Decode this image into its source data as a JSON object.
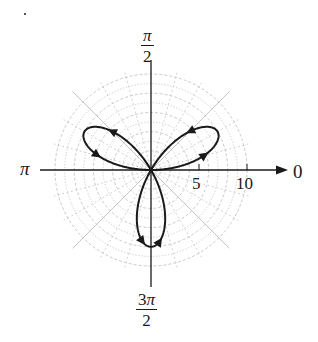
{
  "chart_data": {
    "type": "polar-line",
    "title": "",
    "equation_inferred": "r = 8 sin(3θ)",
    "curve": {
      "kind": "rose",
      "petals": 3,
      "amplitude": 8,
      "petal_directions": [
        "π/6",
        "5π/6",
        "3π/2"
      ],
      "direction_arrows": true
    },
    "radial_axis": {
      "ticks": [
        5,
        10
      ],
      "tick_labels": [
        "5",
        "10"
      ],
      "grid_circles": [
        1,
        2,
        3,
        4,
        5,
        6,
        7,
        8,
        9,
        10
      ],
      "range": [
        0,
        10.5
      ]
    },
    "angular_axis": {
      "labels": [
        {
          "angle": "0",
          "text": "0"
        },
        {
          "angle": "π/2",
          "num": "π",
          "den": "2"
        },
        {
          "angle": "π",
          "text": "π"
        },
        {
          "angle": "3π/2",
          "num": "3π",
          "den": "2"
        }
      ],
      "grid_spokes_deg": [
        0,
        15,
        30,
        45,
        60,
        75,
        90,
        105,
        120,
        135,
        150,
        165,
        180,
        195,
        210,
        225,
        240,
        255,
        270,
        285,
        300,
        315,
        330,
        345
      ]
    },
    "grid": true
  },
  "labels": {
    "zero": "0",
    "pi": "π",
    "half_pi_num": "π",
    "half_pi_den": "2",
    "three_half_pi_num_coef": "3",
    "three_half_pi_num_sym": "π",
    "three_half_pi_den": "2",
    "tick5": "5",
    "tick10": "10"
  },
  "colors": {
    "curve": "#1a1a1a",
    "axis": "#1a1a1a",
    "grid": "#bdbdbd"
  }
}
